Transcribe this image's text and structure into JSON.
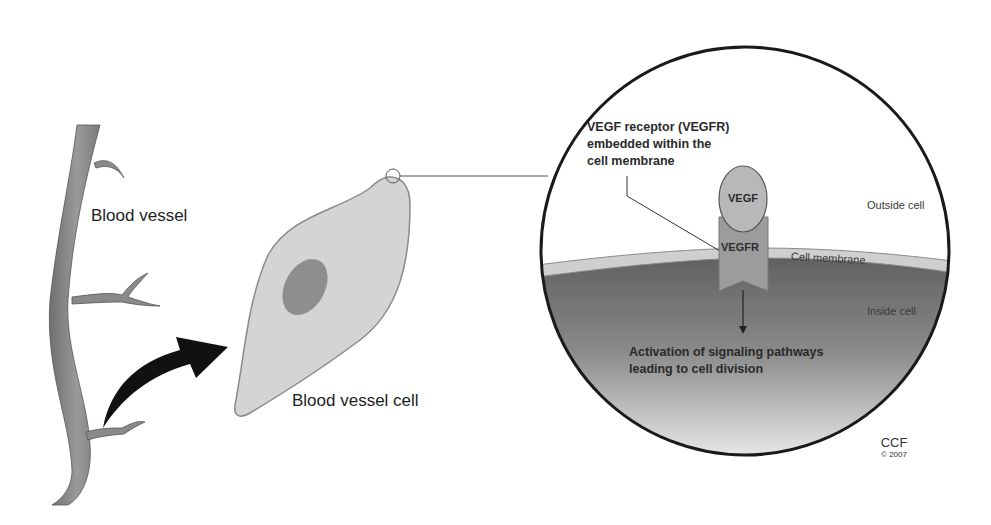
{
  "diagram": {
    "colors": {
      "background": "#ffffff",
      "vessel": "#8a8a8a",
      "cell_fill": "#d4d4d4",
      "nucleus": "#8e8e8e",
      "membrane": "#c8c8c8",
      "cytoplasm_dark": "#6e6e6e",
      "outline": "#1a1a1a"
    },
    "labels": {
      "blood_vessel": "Blood vessel",
      "blood_vessel_cell": "Blood vessel cell",
      "receptor_callout": [
        "VEGF receptor (VEGFR)",
        "embedded within the",
        "cell membrane"
      ],
      "vegf": "VEGF",
      "vegfr": "VEGFR",
      "outside_cell": "Outside cell",
      "cell_membrane": "Cell membrane",
      "inside_cell": "Inside cell",
      "activation": [
        "Activation of signaling pathways",
        "leading to cell division"
      ]
    },
    "credit": {
      "org": "CCF",
      "year": "© 2007"
    }
  }
}
